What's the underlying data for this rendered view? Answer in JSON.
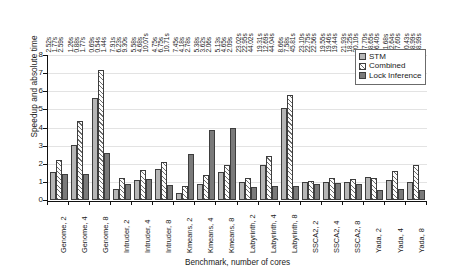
{
  "chart_data": {
    "type": "bar",
    "title": "",
    "xlabel": "Benchmark, number of cores",
    "ylabel": "Speedup and absolute time",
    "ylim": [
      0,
      8
    ],
    "yticks": [
      "0",
      "1",
      "2",
      "3",
      "4",
      "5",
      "6",
      "7",
      "8"
    ],
    "grid": true,
    "legend_position": "top-right",
    "categories": [
      "Genome, 2",
      "Genome, 4",
      "Genome, 8",
      "Intruder, 2",
      "Intruder, 4",
      "Intruder, 8",
      "Kmeans, 2",
      "Kmeans, 4",
      "Kmeans, 8",
      "Labyrinth, 2",
      "Labyrinth, 4",
      "Labyrinth, 8",
      "SSCA2, 2",
      "SSCA2, 4",
      "SSCA2, 8",
      "Yada, 2",
      "Yada, 4",
      "Yada, 8"
    ],
    "series": [
      {
        "name": "STM",
        "values": [
          1.52,
          3.05,
          5.65,
          0.6,
          1.1,
          1.72,
          0.4,
          0.88,
          1.56,
          1.0,
          1.95,
          5.1,
          1.02,
          1.02,
          0.98,
          1.25,
          1.08,
          1.02
        ]
      },
      {
        "name": "Combined",
        "values": [
          2.2,
          4.38,
          7.17,
          1.22,
          1.65,
          2.12,
          0.78,
          1.38,
          1.92,
          1.2,
          2.42,
          5.78,
          1.05,
          1.22,
          1.18,
          1.22,
          1.58,
          1.92
        ]
      },
      {
        "name": "Lock Inference",
        "values": [
          1.45,
          1.42,
          2.62,
          0.9,
          1.18,
          0.82,
          2.55,
          3.85,
          3.98,
          0.72,
          0.78,
          0.8,
          0.9,
          0.95,
          0.9,
          0.58,
          0.62,
          0.55
        ]
      }
    ],
    "time_labels": [
      "2.52s",
      "1.77s",
      "2.59s",
      "1.26s",
      "0.88s",
      "1.77s",
      "0.69s",
      "0.54s",
      "1.44s",
      "7.91s",
      "6.23s",
      "9.30s",
      "5.58s",
      "4.68s",
      "10.07s",
      "4.75s",
      "6.75s",
      "10.71s",
      "7.45s",
      "4.18s",
      "2.78s",
      "5.38s",
      "3.62s",
      "2.06s",
      "5.13s",
      "4.65s",
      "2.09s",
      "23.02s",
      "22.95s",
      "44.02s",
      "19.31s",
      "12.69s",
      "44.04s",
      "8.66s",
      "7.58s",
      "45.81s",
      "23.10s",
      "22.75s",
      "22.56s",
      "19.55s",
      "19.46s",
      "19.44s",
      "21.93s",
      "18.25s",
      "20.10s",
      "17.70s",
      "18.65s",
      "26.40s",
      "11.68s",
      "12.64s",
      "27.60s",
      "10.43s",
      "28.99s",
      "28.99s"
    ]
  },
  "legend": {
    "items": [
      {
        "label": "STM"
      },
      {
        "label": "Combined"
      },
      {
        "label": "Lock Inference"
      }
    ]
  },
  "colors": {
    "stm": "#b6b6b6",
    "combined": "#fdfdfd",
    "lock_inference": "#7a7a7a",
    "axis": "#111111",
    "grid": "#e3e3e3"
  }
}
